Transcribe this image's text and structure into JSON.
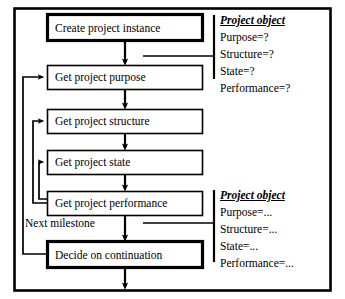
{
  "diagram": {
    "colors": {
      "stroke": "#000000",
      "background": "#ffffff"
    },
    "process_boxes": [
      {
        "id": "create-project-instance",
        "label": "Create project instance",
        "emphasis": "thick"
      },
      {
        "id": "get-project-purpose",
        "label": "Get project purpose",
        "emphasis": "thin"
      },
      {
        "id": "get-project-structure",
        "label": "Get project structure",
        "emphasis": "thin"
      },
      {
        "id": "get-project-state",
        "label": "Get project state",
        "emphasis": "thin"
      },
      {
        "id": "get-project-performance",
        "label": "Get project performance",
        "emphasis": "thin"
      },
      {
        "id": "decide-on-continuation",
        "label": "Decide on continuation",
        "emphasis": "thick"
      }
    ],
    "loop_labels": [
      {
        "id": "next-milestone",
        "label": "Next milestone"
      }
    ],
    "annotations": [
      {
        "id": "project-object-unknown",
        "title": "Project object",
        "attributes": [
          "Purpose=?",
          "Structure=?",
          "State=?",
          "Performance=?"
        ]
      },
      {
        "id": "project-object-known",
        "title": "Project object",
        "attributes": [
          "Purpose=...",
          "Structure=...",
          "State=...",
          "Performance=..."
        ]
      }
    ]
  }
}
